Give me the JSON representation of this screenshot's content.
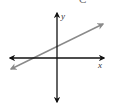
{
  "figure": {
    "top_partial_label": "C",
    "axes": {
      "x_label": "x",
      "y_label": "y",
      "axis_color": "#111111",
      "arrows": "both ends"
    },
    "line": {
      "color": "#8a8a8a",
      "slope_sign": "positive",
      "y_intercept_sign": "positive",
      "arrows": "both ends",
      "description": "Straight line rising from lower-left to upper-right, crossing the y-axis above the origin and the x-axis to the left of the origin"
    }
  }
}
